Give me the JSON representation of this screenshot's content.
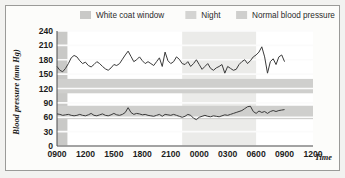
{
  "figure": {
    "background_color": "#f2f2f0",
    "panel_color": "#fcfcfa",
    "border_color": "#9a9a98"
  },
  "legend": {
    "position": "top",
    "items": [
      {
        "label": "White coat window",
        "swatch_color": "#c9c9c7",
        "key": "white-coat-window"
      },
      {
        "label": "Night",
        "swatch_color": "#d4d4d2",
        "key": "night"
      },
      {
        "label": "Normal blood pressure",
        "swatch_color": "#cfcfcd",
        "key": "normal-blood-pressure"
      }
    ]
  },
  "chart_data": {
    "type": "line",
    "title": "",
    "xlabel": "Time",
    "ylabel": "Blood pressure (mm Hg)",
    "ylim": [
      0,
      240
    ],
    "yticks": [
      0,
      30,
      60,
      90,
      120,
      150,
      180,
      210,
      240
    ],
    "ytick_labels": [
      "0",
      "30",
      "60",
      "90",
      "120",
      "150",
      "180",
      "210",
      "240"
    ],
    "xlim": [
      0,
      27
    ],
    "xticks": [
      0,
      3,
      6,
      9,
      12,
      15,
      18,
      21,
      24,
      27
    ],
    "xtick_labels": [
      "0900",
      "1200",
      "1500",
      "1800",
      "2100",
      "0000",
      "0300",
      "0600",
      "0900",
      "1200"
    ],
    "grid": true,
    "grid_color": "#e9e9e7",
    "line_color": "#3a3a3a",
    "bands": [
      {
        "name": "white-coat-window",
        "orientation": "vertical",
        "x_start": 0,
        "x_end": 1.1,
        "color": "#c9c9c7",
        "label": "White coat window"
      },
      {
        "name": "night",
        "orientation": "vertical",
        "x_start": 13.2,
        "x_end": 21.0,
        "color": "#ebebe9",
        "label": "Night"
      },
      {
        "name": "normal-systolic",
        "orientation": "horizontal",
        "y_start": 110,
        "y_end": 140,
        "color": "#cfcfcd",
        "label": "Normal blood pressure"
      },
      {
        "name": "normal-diastolic",
        "orientation": "horizontal",
        "y_start": 56,
        "y_end": 84,
        "color": "#cfcfcd",
        "label": "Normal blood pressure"
      }
    ],
    "series": [
      {
        "name": "Systolic blood pressure",
        "x": [
          0,
          0.3,
          0.6,
          0.9,
          1.2,
          1.5,
          1.8,
          2.1,
          2.4,
          2.7,
          3.0,
          3.3,
          3.6,
          3.9,
          4.2,
          4.5,
          4.8,
          5.1,
          5.4,
          5.7,
          6.0,
          6.3,
          6.6,
          6.9,
          7.2,
          7.5,
          7.8,
          8.1,
          8.4,
          8.7,
          9.0,
          9.3,
          9.6,
          9.9,
          10.2,
          10.5,
          10.8,
          11.1,
          11.4,
          11.7,
          12.0,
          12.3,
          12.6,
          12.9,
          13.2,
          13.5,
          13.8,
          14.1,
          14.4,
          14.7,
          15.0,
          15.3,
          15.6,
          15.9,
          16.2,
          16.5,
          16.8,
          17.1,
          17.4,
          17.7,
          18.0,
          18.3,
          18.6,
          18.9,
          19.2,
          19.5,
          19.8,
          20.1,
          20.4,
          20.7,
          21.0,
          21.3,
          21.6,
          21.9,
          22.2,
          22.5,
          22.8,
          23.1,
          23.4,
          23.7,
          24.0
        ],
        "values": [
          166,
          158,
          155,
          162,
          172,
          184,
          189,
          186,
          178,
          172,
          175,
          168,
          165,
          170,
          176,
          172,
          166,
          161,
          158,
          163,
          170,
          168,
          172,
          181,
          190,
          198,
          187,
          176,
          180,
          186,
          178,
          172,
          176,
          172,
          168,
          176,
          184,
          166,
          196,
          178,
          172,
          176,
          186,
          181,
          172,
          170,
          176,
          166,
          172,
          180,
          170,
          160,
          166,
          172,
          162,
          158,
          163,
          166,
          170,
          152,
          166,
          162,
          158,
          160,
          170,
          176,
          180,
          172,
          178,
          186,
          190,
          196,
          207,
          186,
          152,
          176,
          182,
          170,
          186,
          190,
          176
        ]
      },
      {
        "name": "Diastolic blood pressure",
        "x": [
          0,
          0.3,
          0.6,
          0.9,
          1.2,
          1.5,
          1.8,
          2.1,
          2.4,
          2.7,
          3.0,
          3.3,
          3.6,
          3.9,
          4.2,
          4.5,
          4.8,
          5.1,
          5.4,
          5.7,
          6.0,
          6.3,
          6.6,
          6.9,
          7.2,
          7.5,
          7.8,
          8.1,
          8.4,
          8.7,
          9.0,
          9.3,
          9.6,
          9.9,
          10.2,
          10.5,
          10.8,
          11.1,
          11.4,
          11.7,
          12.0,
          12.3,
          12.6,
          12.9,
          13.2,
          13.5,
          13.8,
          14.1,
          14.4,
          14.7,
          15.0,
          15.3,
          15.6,
          15.9,
          16.2,
          16.5,
          16.8,
          17.1,
          17.4,
          17.7,
          18.0,
          18.3,
          18.6,
          18.9,
          19.2,
          19.5,
          19.8,
          20.1,
          20.4,
          20.7,
          21.0,
          21.3,
          21.6,
          21.9,
          22.2,
          22.5,
          22.8,
          23.1,
          23.4,
          23.7,
          24.0
        ],
        "values": [
          67,
          66,
          64,
          65,
          66,
          64,
          63,
          64,
          66,
          64,
          63,
          65,
          68,
          64,
          63,
          65,
          67,
          64,
          63,
          65,
          68,
          65,
          64,
          66,
          70,
          80,
          70,
          66,
          68,
          67,
          65,
          66,
          64,
          63,
          62,
          64,
          66,
          62,
          66,
          65,
          64,
          66,
          64,
          62,
          60,
          62,
          66,
          64,
          58,
          55,
          60,
          62,
          64,
          62,
          61,
          63,
          62,
          61,
          63,
          65,
          64,
          66,
          68,
          70,
          72,
          74,
          78,
          82,
          83,
          72,
          68,
          73,
          70,
          72,
          68,
          72,
          74,
          72,
          74,
          75,
          76
        ]
      }
    ]
  }
}
